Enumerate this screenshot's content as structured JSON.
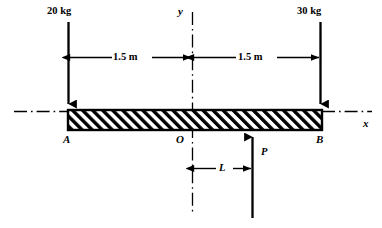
{
  "figure": {
    "width": 382,
    "height": 228,
    "background": "#ffffff",
    "ink": "#000000"
  },
  "loads": {
    "left": {
      "label": "20 kg",
      "value": 20,
      "unit": "kg",
      "direction": "down",
      "x": 68
    },
    "right": {
      "label": "30 kg",
      "value": 30,
      "unit": "kg",
      "direction": "down",
      "x": 320
    },
    "reaction": {
      "label": "P",
      "direction": "up",
      "x": 252
    }
  },
  "dimensions": {
    "left_span": {
      "label": "1.5 m",
      "value": 1.5,
      "unit": "m",
      "from": "A",
      "to": "O"
    },
    "right_span": {
      "label": "1.5 m",
      "value": 1.5,
      "unit": "m",
      "from": "O",
      "to": "B"
    },
    "reaction_offset": {
      "label": "L",
      "from": "O",
      "to": "P"
    }
  },
  "points": {
    "a": "A",
    "o": "O",
    "b": "B"
  },
  "axes": {
    "x_label": "x",
    "y_label": "y",
    "x_style": "dash-dot",
    "y_style": "dash-dot"
  },
  "beam": {
    "fill": "hatched",
    "hatch_angle_deg": 45,
    "left_x": 68,
    "right_x": 322,
    "top_y": 111,
    "bottom_y": 129
  }
}
